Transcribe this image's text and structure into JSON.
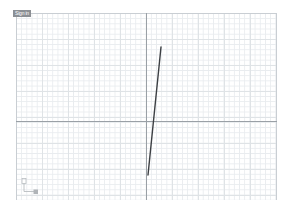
{
  "app": {
    "title": "Grid Drawing Canvas",
    "background_color": "#ffffff"
  },
  "layer_label": {
    "text": "Sign in",
    "background_color": "#8b8f94",
    "text_color": "#ffffff"
  },
  "canvas": {
    "left": 16,
    "top": 13,
    "width": 261,
    "height": 187,
    "minor_grid_px": 5.2,
    "medium_grid_px": 26,
    "major_grid_px": 130,
    "minor_grid_color": "#e9ecef",
    "medium_grid_color": "#dfe3e6",
    "major_grid_color": "#c9ced3",
    "axis_color": "#9aa0a6"
  },
  "axes": {
    "vertical_axis_x": 130,
    "horizontal_axis_y": 108
  },
  "origin_indicator": {
    "name": "origin-axis-marker",
    "x_label": "x",
    "y_label": "y",
    "color": "#b0b4b8"
  },
  "chart_data": {
    "type": "line",
    "title": "",
    "xlabel": "",
    "ylabel": "",
    "grid": true,
    "legend": "none",
    "xlim": [
      0,
      261
    ],
    "ylim": [
      0,
      187
    ],
    "series": [
      {
        "name": "segment-1",
        "color": "#3c3f43",
        "width": 1.4,
        "points": [
          {
            "x": 145,
            "y": 34
          },
          {
            "x": 132,
            "y": 162
          }
        ]
      }
    ]
  }
}
